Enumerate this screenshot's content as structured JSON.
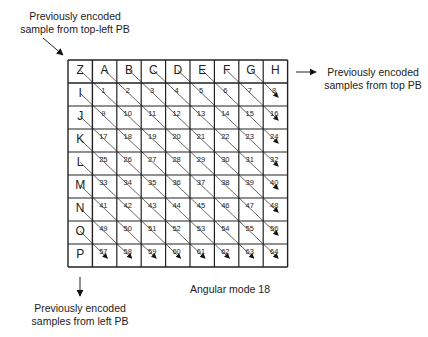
{
  "labels": {
    "top_left": [
      "Previously encoded",
      "sample from top-left PB"
    ],
    "top": [
      "Previously encoded",
      "samples from top PB"
    ],
    "left": [
      "Previously encoded",
      "samples from left PB"
    ],
    "mode": "Angular mode 18"
  },
  "grid": {
    "corner": "Z",
    "top_refs": [
      "A",
      "B",
      "C",
      "D",
      "E",
      "F",
      "G",
      "H"
    ],
    "left_refs": [
      "I",
      "J",
      "K",
      "L",
      "M",
      "N",
      "O",
      "P"
    ],
    "rows": 8,
    "cols": 8,
    "first_index": 1
  },
  "colors": {
    "line": "#222222",
    "diag": "#555555",
    "bg": "#ffffff"
  }
}
